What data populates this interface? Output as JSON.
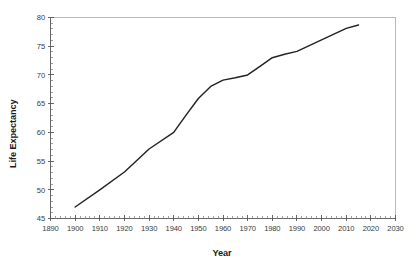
{
  "chart_data": {
    "type": "line",
    "title": "",
    "subtitle": "",
    "xlabel": "Year",
    "ylabel": "Life Expectancy",
    "xlim": [
      1890,
      2030
    ],
    "ylim": [
      45,
      80
    ],
    "grid": false,
    "legend": null,
    "x_ticks": [
      1890,
      1900,
      1910,
      1920,
      1930,
      1940,
      1950,
      1960,
      1970,
      1980,
      1990,
      2000,
      2010,
      2020,
      2030
    ],
    "x_tick_labels": [
      "1890",
      "1900",
      "1910",
      "1920",
      "1930",
      "1940",
      "1950",
      "1960",
      "1970",
      "1980",
      "1990",
      "2000",
      "2010",
      "2020",
      "2030"
    ],
    "x_minor_step": 2,
    "y_ticks": [
      45,
      50,
      55,
      60,
      65,
      70,
      75,
      80
    ],
    "y_tick_labels": [
      "45",
      "50",
      "55",
      "60",
      "65",
      "70",
      "75",
      "80"
    ],
    "y_minor_step": 1,
    "series": [
      {
        "name": "Life Expectancy",
        "color": "#232323",
        "x": [
          1900,
          1910,
          1920,
          1930,
          1940,
          1945,
          1950,
          1955,
          1960,
          1965,
          1970,
          1975,
          1980,
          1985,
          1990,
          2000,
          2010,
          2015
        ],
        "values": [
          47.0,
          50.0,
          53.1,
          57.1,
          60.0,
          63.0,
          65.9,
          68.0,
          69.1,
          69.5,
          70.0,
          71.5,
          73.0,
          73.6,
          74.1,
          76.1,
          78.1,
          78.7
        ]
      }
    ],
    "annotations": []
  },
  "axes": {
    "y_axis_title": "Life Expectancy",
    "x_axis_title": "Year"
  },
  "style": {
    "background": "#ffffff",
    "line_color": "#232323",
    "spine_color": "#b9b9b9",
    "axis_color": "#555555",
    "tick_label_color": "#3a3a3a"
  }
}
